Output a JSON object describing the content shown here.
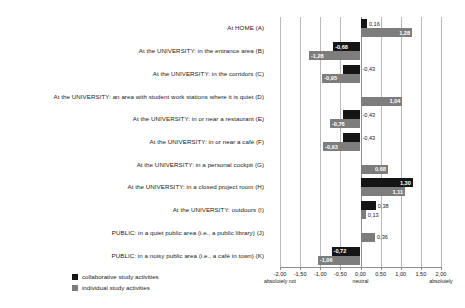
{
  "chart_data": {
    "type": "bar",
    "orientation": "horizontal",
    "title": "",
    "xlabel": "",
    "ylabel": "",
    "xlim": [
      -2.0,
      2.0
    ],
    "grid": true,
    "legend_position": "bottom-left",
    "tick_labels": [
      "-2,00",
      "-1,50",
      "-1,00",
      "-0,50",
      "0,00",
      "0,50",
      "1,00",
      "1,50",
      "2,00"
    ],
    "tick_values": [
      -2.0,
      -1.5,
      -1.0,
      -0.5,
      0.0,
      0.5,
      1.0,
      1.5,
      2.0
    ],
    "anchors": [
      {
        "value": -2.0,
        "label": "absolutely not"
      },
      {
        "value": 0.0,
        "label": "neutral"
      },
      {
        "value": 2.0,
        "label": "absolutely"
      }
    ],
    "categories": [
      "At HOME (A)",
      "At the UNIVERSITY: in the entrance area (B)",
      "At the UNIVERSITY: in the corridors (C)",
      "At the UNIVERSITY: an area with student work stations where it is quiet (D)",
      "At the UNIVERSITY: in or near a restaurant (E)",
      "At the UNIVERSITY: in or near a café (F)",
      "At the UNIVERSITY: in a personal cockpit (G)",
      "At the UNIVERSITY: in a closed project room (H)",
      "At the UNIVERSITY: outdoors (I)",
      "PUBLIC: in a quiet public area (i.e., a public library) (J)",
      "PUBLIC: in a noisy public area (i.e., a café in town) (K)"
    ],
    "series": [
      {
        "name": "collaborative study activities",
        "color": "#151515",
        "values": [
          0.16,
          -0.68,
          -0.43,
          null,
          -0.43,
          -0.43,
          null,
          1.3,
          0.38,
          null,
          -0.72
        ],
        "labels": [
          "0,16",
          "-0,68",
          "-0,43",
          "",
          "-0,43",
          "-0,43",
          "",
          "1,30",
          "0,38",
          "",
          "-0,72"
        ]
      },
      {
        "name": "individual study activities",
        "color": "#7d7d7d",
        "values": [
          1.28,
          -1.28,
          -0.95,
          1.04,
          -0.76,
          -0.93,
          0.68,
          1.11,
          0.13,
          0.36,
          -1.06
        ],
        "labels": [
          "1,28",
          "-1,28",
          "-0,95",
          "1,04",
          "-0,76",
          "-0,93",
          "0,68",
          "1,11",
          "0,13",
          "0,36",
          "-1,06"
        ]
      }
    ]
  },
  "legend": {
    "items": [
      {
        "label": "collaborative study activities",
        "swatch": "collab"
      },
      {
        "label": "individual study activities",
        "swatch": "indiv"
      }
    ]
  }
}
